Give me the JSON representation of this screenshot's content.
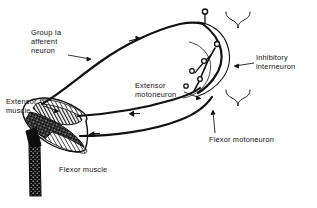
{
  "figure": {
    "background_color": "#ffffff",
    "ink_color": "#111111",
    "width": 317,
    "height": 208
  },
  "labels": {
    "group_ia_afferent_neuron": "Group Ia\nafferent\nneuron",
    "extensor_muscle": "Extensor\nmuscle",
    "flexor_muscle": "Flexor muscle",
    "extensor_motoneuron": "Extensor\nmotoneuron",
    "flexor_motoneuron": "Flexor motoneuron",
    "inhibitory_interneuron": "Inhibitory\ninterneuron"
  },
  "annotations": {
    "synaptic_terminal_top": "synaptic terminal",
    "flow_arrow_afferent": "signal direction arrow on afferent fiber",
    "flow_arrow_extensor": "signal direction arrow on extensor motor fiber",
    "flow_arrow_flexor": "signal direction arrow on flexor motor fiber",
    "brace_upper": "brace marking inhibitory interneuron region",
    "brace_lower": "brace marking motoneuron pool region"
  },
  "structures": {
    "extensor_muscle_fill": "hatched striations",
    "flexor_muscle_fill": "dark stippled",
    "tendon": "dark stippled tendon"
  }
}
